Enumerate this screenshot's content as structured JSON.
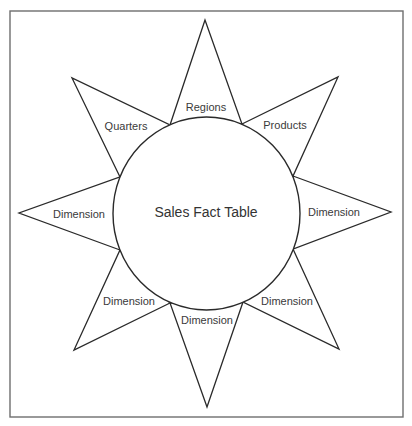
{
  "diagram": {
    "type": "star-schema",
    "center": {
      "label": "Sales Fact Table"
    },
    "rays": [
      {
        "id": "top",
        "label": "Regions"
      },
      {
        "id": "top-right",
        "label": "Products"
      },
      {
        "id": "right",
        "label": "Dimension"
      },
      {
        "id": "bottom-right",
        "label": "Dimension"
      },
      {
        "id": "bottom",
        "label": "Dimension"
      },
      {
        "id": "bottom-left",
        "label": "Dimension"
      },
      {
        "id": "left",
        "label": "Dimension"
      },
      {
        "id": "top-left",
        "label": "Quarters"
      }
    ],
    "colors": {
      "stroke": "#2a2a2a",
      "frame": "#6e6e6e",
      "text": "#333333",
      "background": "#ffffff"
    }
  }
}
